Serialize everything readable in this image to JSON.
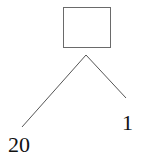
{
  "diagram": {
    "type": "tree",
    "root": {
      "shape": "rectangle",
      "label": ""
    },
    "children": [
      {
        "label": "20",
        "side": "left"
      },
      {
        "label": "1",
        "side": "right"
      }
    ],
    "colors": {
      "stroke": "#555555",
      "text": "#111111",
      "background": "#ffffff"
    }
  }
}
